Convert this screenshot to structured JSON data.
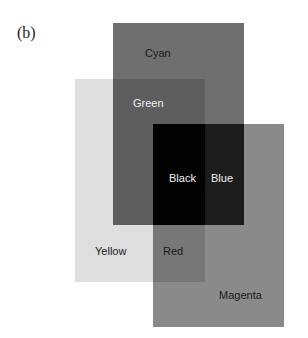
{
  "figure": {
    "panel_label": "(b)"
  },
  "colors": {
    "background": "#ffffff",
    "yellow_only": "#dedede",
    "cyan_only": "#6f6f6f",
    "magenta_only": "#8a8a8a",
    "green": "#5e5e5e",
    "red": "#777777",
    "blue": "#1c1c1c",
    "black": "#030303"
  },
  "filters": [
    {
      "name": "Cyan",
      "x": 113,
      "y": 23,
      "w": 131,
      "h": 202
    },
    {
      "name": "Yellow",
      "x": 75,
      "y": 79,
      "w": 130,
      "h": 203
    },
    {
      "name": "Magenta",
      "x": 153,
      "y": 124,
      "w": 131,
      "h": 203
    }
  ],
  "labels": {
    "cyan": "Cyan",
    "green": "Green",
    "black": "Black",
    "blue": "Blue",
    "yellow": "Yellow",
    "red": "Red",
    "magenta": "Magenta"
  }
}
